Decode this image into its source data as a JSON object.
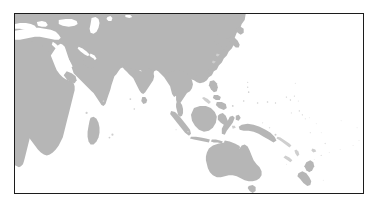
{
  "figure": {
    "type": "map",
    "title": "",
    "caption": "",
    "projection": "equirectangular",
    "region_name": "Indian Ocean, Southeast Asia and Oceania",
    "background_color": "#ffffff",
    "land_color": "#b6b6b6",
    "ocean_color": "#ffffff",
    "border_color": "#1c1c1c",
    "frame": {
      "x": 14,
      "y": 13,
      "width": 350,
      "height": 181,
      "border_width_px": 1.5
    },
    "extent": {
      "lon_min": 20,
      "lon_max": 200,
      "lat_min": -55,
      "lat_max": 55
    },
    "graticule_visible": false,
    "labels_visible": false,
    "legend_visible": false
  },
  "features": {
    "continents": [
      {
        "name": "Africa",
        "color": "#b6b6b6"
      },
      {
        "name": "Europe",
        "color": "#b6b6b6"
      },
      {
        "name": "Asia",
        "color": "#b6b6b6"
      },
      {
        "name": "Australia",
        "color": "#b6b6b6"
      }
    ],
    "seas": [
      {
        "name": "Mediterranean Sea",
        "color": "#ffffff"
      },
      {
        "name": "Black Sea",
        "color": "#ffffff"
      },
      {
        "name": "Caspian Sea",
        "color": "#ffffff"
      },
      {
        "name": "Red Sea",
        "color": "#ffffff"
      },
      {
        "name": "Persian Gulf",
        "color": "#ffffff"
      },
      {
        "name": "Indian Ocean",
        "color": "#ffffff"
      },
      {
        "name": "Pacific Ocean",
        "color": "#ffffff"
      },
      {
        "name": "Bay of Bengal",
        "color": "#ffffff"
      },
      {
        "name": "Arabian Sea",
        "color": "#ffffff"
      },
      {
        "name": "South China Sea",
        "color": "#ffffff"
      },
      {
        "name": "Coral Sea",
        "color": "#ffffff"
      },
      {
        "name": "Tasman Sea",
        "color": "#ffffff"
      }
    ],
    "islands": [
      {
        "name": "Madagascar",
        "color": "#b6b6b6"
      },
      {
        "name": "Sri Lanka",
        "color": "#b6b6b6"
      },
      {
        "name": "Sumatra",
        "color": "#b6b6b6"
      },
      {
        "name": "Java",
        "color": "#b6b6b6"
      },
      {
        "name": "Borneo",
        "color": "#b6b6b6"
      },
      {
        "name": "Sulawesi",
        "color": "#b6b6b6"
      },
      {
        "name": "New Guinea",
        "color": "#b6b6b6"
      },
      {
        "name": "Philippines",
        "color": "#b6b6b6"
      },
      {
        "name": "Japan",
        "color": "#b6b6b6"
      },
      {
        "name": "Tasmania",
        "color": "#b6b6b6"
      },
      {
        "name": "New Zealand",
        "color": "#b6b6b6"
      },
      {
        "name": "Pacific island groups",
        "color": "#cfcfcf"
      }
    ]
  }
}
